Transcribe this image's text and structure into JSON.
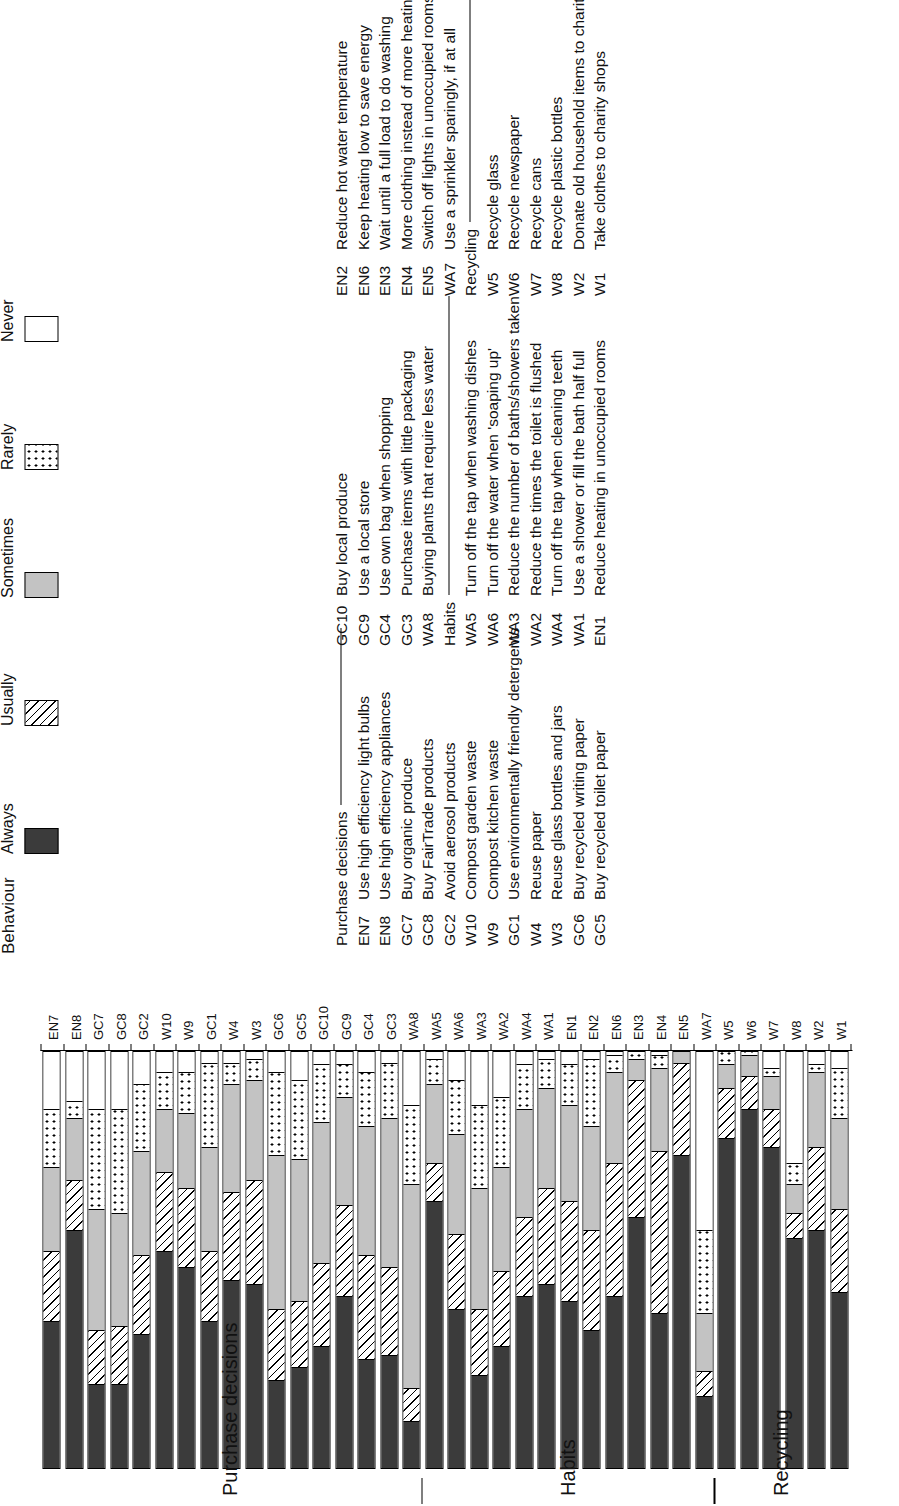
{
  "chart_data": {
    "type": "bar",
    "orientation": "horizontal-stacked",
    "title": "",
    "xlabel": "",
    "ylabel": "",
    "stacked_percent": true,
    "xlim": [
      0,
      100
    ],
    "grid": false,
    "legend_title": "Behaviour",
    "legend_position": "right",
    "series": [
      {
        "name": "Always",
        "pattern": "solid-dark",
        "color": "#3b3b3b"
      },
      {
        "name": "Usually",
        "pattern": "diagonal-hatch",
        "color": "#ffffff"
      },
      {
        "name": "Sometimes",
        "pattern": "solid-light",
        "color": "#c3c3c3"
      },
      {
        "name": "Rarely",
        "pattern": "dotted",
        "color": "#ffffff"
      },
      {
        "name": "Never",
        "pattern": "empty",
        "color": "#ffffff"
      }
    ],
    "group_labels": [
      "Purchase decisions",
      "Habits",
      "Recycling"
    ],
    "categories": [
      "EN7",
      "EN8",
      "GC7",
      "GC8",
      "GC2",
      "W10",
      "W9",
      "GC1",
      "W4",
      "W3",
      "GC6",
      "GC5",
      "GC10",
      "GC9",
      "GC4",
      "GC3",
      "WA8",
      "WA5",
      "WA6",
      "WA3",
      "WA2",
      "WA4",
      "WA1",
      "EN1",
      "EN2",
      "EN6",
      "EN3",
      "EN4",
      "EN5",
      "WA7",
      "W5",
      "W6",
      "W7",
      "W8",
      "W2",
      "W1"
    ],
    "bars": [
      {
        "cat": "EN7",
        "group": "Purchase decisions",
        "values": [
          35,
          17,
          20,
          14,
          14
        ]
      },
      {
        "cat": "EN8",
        "group": "Purchase decisions",
        "values": [
          57,
          12,
          15,
          4,
          12
        ]
      },
      {
        "cat": "GC7",
        "group": "Purchase decisions",
        "values": [
          20,
          13,
          29,
          24,
          14
        ]
      },
      {
        "cat": "GC8",
        "group": "Purchase decisions",
        "values": [
          20,
          14,
          27,
          25,
          14
        ]
      },
      {
        "cat": "GC2",
        "group": "Purchase decisions",
        "values": [
          32,
          19,
          25,
          16,
          8
        ]
      },
      {
        "cat": "W10",
        "group": "Purchase decisions",
        "values": [
          52,
          19,
          15,
          9,
          5
        ]
      },
      {
        "cat": "W9",
        "group": "Purchase decisions",
        "values": [
          48,
          19,
          18,
          10,
          5
        ]
      },
      {
        "cat": "GC1",
        "group": "Purchase decisions",
        "values": [
          35,
          17,
          25,
          20,
          3
        ]
      },
      {
        "cat": "W4",
        "group": "Purchase decisions",
        "values": [
          45,
          21,
          26,
          5,
          3
        ]
      },
      {
        "cat": "W3",
        "group": "Purchase decisions",
        "values": [
          44,
          25,
          24,
          5,
          2
        ]
      },
      {
        "cat": "GC6",
        "group": "Purchase decisions",
        "values": [
          21,
          17,
          37,
          20,
          5
        ]
      },
      {
        "cat": "GC5",
        "group": "Purchase decisions",
        "values": [
          24,
          16,
          34,
          19,
          7
        ]
      },
      {
        "cat": "GC10",
        "group": "Purchase decisions",
        "values": [
          29,
          20,
          34,
          14,
          3
        ]
      },
      {
        "cat": "GC9",
        "group": "Purchase decisions",
        "values": [
          41,
          22,
          26,
          8,
          3
        ]
      },
      {
        "cat": "GC4",
        "group": "Purchase decisions",
        "values": [
          26,
          25,
          31,
          13,
          5
        ]
      },
      {
        "cat": "GC3",
        "group": "Purchase decisions",
        "values": [
          27,
          21,
          36,
          13,
          3
        ]
      },
      {
        "cat": "WA8",
        "group": "Purchase decisions",
        "values": [
          11,
          8,
          49,
          19,
          13
        ]
      },
      {
        "cat": "WA5",
        "group": "Habits",
        "values": [
          64,
          9,
          19,
          6,
          2
        ]
      },
      {
        "cat": "WA6",
        "group": "Habits",
        "values": [
          38,
          18,
          24,
          13,
          7
        ]
      },
      {
        "cat": "WA3",
        "group": "Habits",
        "values": [
          22,
          16,
          29,
          20,
          13
        ]
      },
      {
        "cat": "WA2",
        "group": "Habits",
        "values": [
          29,
          18,
          25,
          17,
          11
        ]
      },
      {
        "cat": "WA4",
        "group": "Habits",
        "values": [
          41,
          19,
          26,
          11,
          3
        ]
      },
      {
        "cat": "WA1",
        "group": "Habits",
        "values": [
          44,
          23,
          24,
          7,
          2
        ]
      },
      {
        "cat": "EN1",
        "group": "Habits",
        "values": [
          40,
          24,
          23,
          10,
          3
        ]
      },
      {
        "cat": "EN2",
        "group": "Habits",
        "values": [
          33,
          24,
          25,
          16,
          2
        ]
      },
      {
        "cat": "EN6",
        "group": "Habits",
        "values": [
          41,
          32,
          22,
          4,
          1
        ]
      },
      {
        "cat": "EN3",
        "group": "Habits",
        "values": [
          60,
          33,
          5,
          2,
          0
        ]
      },
      {
        "cat": "EN4",
        "group": "Habits",
        "values": [
          37,
          39,
          20,
          3,
          1
        ]
      },
      {
        "cat": "EN5",
        "group": "Habits",
        "values": [
          75,
          22,
          3,
          0,
          0
        ]
      },
      {
        "cat": "WA7",
        "group": "Habits",
        "values": [
          17,
          6,
          14,
          20,
          43
        ]
      },
      {
        "cat": "W5",
        "group": "Recycling",
        "values": [
          79,
          12,
          6,
          3,
          0
        ]
      },
      {
        "cat": "W6",
        "group": "Recycling",
        "values": [
          86,
          8,
          5,
          1,
          0
        ]
      },
      {
        "cat": "W7",
        "group": "Recycling",
        "values": [
          77,
          9,
          8,
          2,
          4
        ]
      },
      {
        "cat": "W8",
        "group": "Recycling",
        "values": [
          55,
          6,
          7,
          5,
          27
        ]
      },
      {
        "cat": "W2",
        "group": "Recycling",
        "values": [
          57,
          20,
          18,
          2,
          3
        ]
      },
      {
        "cat": "W1",
        "group": "Recycling",
        "values": [
          42,
          20,
          22,
          12,
          4
        ]
      }
    ],
    "group_spans": [
      {
        "label": "Purchase decisions",
        "from": "EN7",
        "to": "WA8"
      },
      {
        "label": "Habits",
        "from": "WA5",
        "to": "WA7"
      },
      {
        "label": "Recycling",
        "from": "W5",
        "to": "W1"
      }
    ]
  },
  "legend": {
    "title": "Behaviour",
    "items": [
      {
        "label": "Always"
      },
      {
        "label": "Usually"
      },
      {
        "label": "Sometimes"
      },
      {
        "label": "Rarely"
      },
      {
        "label": "Never"
      }
    ]
  },
  "keys": {
    "col1": {
      "heading": "Purchase decisions",
      "rows": [
        {
          "code": "EN7",
          "text": "Use high efficiency light bulbs"
        },
        {
          "code": "EN8",
          "text": "Use high efficiency appliances"
        },
        {
          "code": "GC7",
          "text": "Buy organic produce"
        },
        {
          "code": "GC8",
          "text": "Buy FairTrade products"
        },
        {
          "code": "GC2",
          "text": "Avoid aerosol products"
        },
        {
          "code": "W10",
          "text": "Compost garden waste"
        },
        {
          "code": "W9",
          "text": "Compost kitchen waste"
        },
        {
          "code": "GC1",
          "text": "Use environmentally friendly detergents"
        },
        {
          "code": "W4",
          "text": "Reuse paper"
        },
        {
          "code": "W3",
          "text": "Reuse glass bottles and jars"
        },
        {
          "code": "GC6",
          "text": "Buy recycled writing paper"
        },
        {
          "code": "GC5",
          "text": "Buy recycled toilet paper"
        }
      ]
    },
    "col2": {
      "rows_top": [
        {
          "code": "GC10",
          "text": "Buy local produce"
        },
        {
          "code": "GC9",
          "text": "Use a local store"
        },
        {
          "code": "GC4",
          "text": "Use own bag when shopping"
        },
        {
          "code": "GC3",
          "text": "Purchase items with little packaging"
        },
        {
          "code": "WA8",
          "text": "Buying plants that require less water"
        }
      ],
      "heading": "Habits",
      "rows_bottom": [
        {
          "code": "WA5",
          "text": "Turn off the tap when washing dishes"
        },
        {
          "code": "WA6",
          "text": "Turn off the water when 'soaping up'"
        },
        {
          "code": "WA3",
          "text": "Reduce the number of baths/showers taken"
        },
        {
          "code": "WA2",
          "text": "Reduce the times the toilet is flushed"
        },
        {
          "code": "WA4",
          "text": "Turn off the tap when cleaning teeth"
        },
        {
          "code": "WA1",
          "text": "Use a shower or fill the bath half full"
        },
        {
          "code": "EN1",
          "text": "Reduce heating in unoccupied rooms"
        }
      ]
    },
    "col3": {
      "rows_top": [
        {
          "code": "EN2",
          "text": "Reduce hot water temperature"
        },
        {
          "code": "EN6",
          "text": "Keep heating low to save energy"
        },
        {
          "code": "EN3",
          "text": "Wait until a full load to do washing"
        },
        {
          "code": "EN4",
          "text": "More clothing instead of more heating"
        },
        {
          "code": "EN5",
          "text": "Switch off lights in unoccupied rooms"
        },
        {
          "code": "WA7",
          "text": "Use a sprinkler sparingly, if at all"
        }
      ],
      "heading": "Recycling",
      "rows_bottom": [
        {
          "code": "W5",
          "text": "Recycle glass"
        },
        {
          "code": "W6",
          "text": "Recycle newspaper"
        },
        {
          "code": "W7",
          "text": "Recycle cans"
        },
        {
          "code": "W8",
          "text": "Recycle plastic bottles"
        },
        {
          "code": "W2",
          "text": "Donate old household items to charity"
        },
        {
          "code": "W1",
          "text": "Take clothes to charity shops"
        }
      ]
    }
  }
}
